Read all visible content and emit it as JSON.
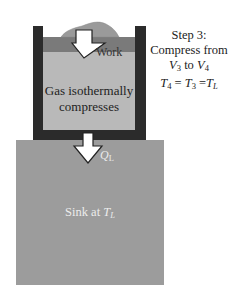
{
  "diagram": {
    "step": {
      "title": "Step 3:",
      "line2": "Compress from",
      "line3_prefix": "V",
      "line3_sub1": "3",
      "line3_mid": " to ",
      "line3_var2": "V",
      "line3_sub2": "4",
      "line4_t1": "T",
      "line4_sub1": "4",
      "line4_eq1": " = ",
      "line4_t2": "T",
      "line4_sub2": "3",
      "line4_eq2": " =",
      "line4_t3": "T",
      "line4_sub3": "L"
    },
    "work_label": "Work",
    "gas_label_line1": "Gas isothermally",
    "gas_label_line2": "compresses",
    "heat_label": "Q",
    "heat_label_sub": "L",
    "sink_label_prefix": "Sink at ",
    "sink_label_var": "T",
    "sink_label_sub": "L",
    "colors": {
      "wall": "#2b2b2b",
      "piston": "#7a7a7a",
      "gas": "#b9b9b9",
      "sink": "#9c9c9c",
      "mound": "#9a9a9a",
      "arrow_fill": "#ffffff",
      "arrow_stroke": "#222222"
    }
  }
}
